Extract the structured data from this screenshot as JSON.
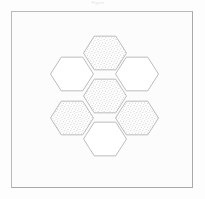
{
  "figure": {
    "title_remnant": "Figure",
    "caption": "",
    "background_color": "#fdfdfd",
    "frame": {
      "x": 11,
      "y": 11,
      "width": 182,
      "height": 177,
      "fill": "#fcfcfc",
      "border_color": "#b9b9b9"
    }
  },
  "palette": {
    "outline": "#b4b4b4",
    "stipple_dot": "#9a9a9a",
    "plain_fill": "#ffffff",
    "stipple_base": "#fefefe",
    "frame_border": "#b9b9b9",
    "page_background": "#fdfdfd"
  },
  "diagram_data": {
    "type": "hexagonal-tiling",
    "description": "Seven flat-top hexagons in a hexagonal rosette (honeycomb flower) arrangement; four are stipple-shaded and three are left blank.",
    "orientation": "flat-top",
    "hex_radius": 21.5,
    "center": {
      "x": 105,
      "y": 96
    },
    "counts": {
      "total": 7,
      "shaded": 4,
      "unshaded": 3
    },
    "cells": [
      {
        "id": "top-center",
        "label": "N",
        "cx": 105,
        "cy": 53,
        "fill": "stipple"
      },
      {
        "id": "upper-left",
        "label": "NW",
        "cx": 72,
        "cy": 74,
        "fill": "plain"
      },
      {
        "id": "upper-right",
        "label": "NE",
        "cx": 137,
        "cy": 74,
        "fill": "plain"
      },
      {
        "id": "center",
        "label": "C",
        "cx": 105,
        "cy": 96,
        "fill": "stipple"
      },
      {
        "id": "lower-left",
        "label": "SW",
        "cx": 72,
        "cy": 118,
        "fill": "stipple"
      },
      {
        "id": "lower-right",
        "label": "SE",
        "cx": 137,
        "cy": 118,
        "fill": "stipple"
      },
      {
        "id": "bottom-center",
        "label": "S",
        "cx": 105,
        "cy": 139,
        "fill": "plain"
      }
    ]
  }
}
